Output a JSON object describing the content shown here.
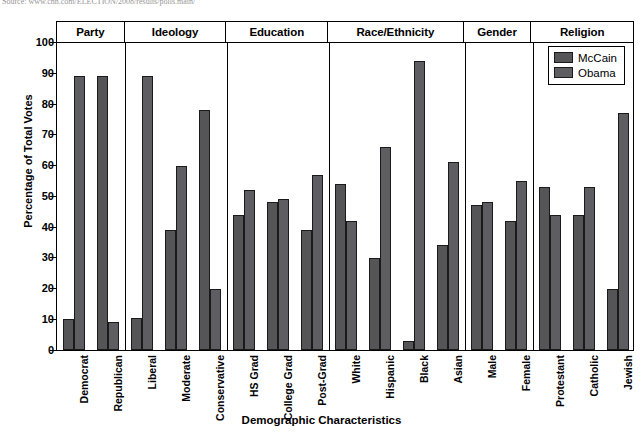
{
  "source_note": "Source: www.cnn.com/ELECTION/2008/results/polls.main/",
  "legend": {
    "position": "top-right-inside",
    "items": [
      {
        "label": "McCain",
        "color": "#555558"
      },
      {
        "label": "Obama",
        "color": "#5e5e62"
      }
    ]
  },
  "groups": [
    {
      "label": "Party",
      "count": 2
    },
    {
      "label": "Ideology",
      "count": 3
    },
    {
      "label": "Education",
      "count": 3
    },
    {
      "label": "Race/Ethnicity",
      "count": 4
    },
    {
      "label": "Gender",
      "count": 2
    },
    {
      "label": "Religion",
      "count": 3
    }
  ],
  "yticks": [
    "0",
    "10",
    "20",
    "30",
    "40",
    "50",
    "60",
    "70",
    "80",
    "90",
    "100"
  ],
  "chart_data": {
    "type": "bar",
    "title": "",
    "xlabel": "Demographic Characteristics",
    "ylabel": "Percentage of Total Votes",
    "ylim": [
      0,
      100
    ],
    "ytick_step": 10,
    "grid": false,
    "legend_position": "upper right",
    "categories": [
      "Democrat",
      "Republican",
      "Liberal",
      "Moderate",
      "Conservative",
      "HS Grad",
      "College Grad",
      "Post-Grad",
      "White",
      "Hispanic",
      "Black",
      "Asian",
      "Male",
      "Female",
      "Protestant",
      "Catholic",
      "Jewish"
    ],
    "series": [
      {
        "name": "McCain",
        "color": "#555558",
        "values": [
          10,
          89,
          10.5,
          39,
          78,
          44,
          48,
          39,
          54,
          30,
          3,
          34,
          47,
          42,
          53,
          44,
          20
        ]
      },
      {
        "name": "Obama",
        "color": "#5e5e62",
        "values": [
          89,
          9,
          89,
          60,
          20,
          52,
          49,
          57,
          42,
          66,
          94,
          61,
          48,
          55,
          44,
          53,
          77
        ]
      }
    ]
  }
}
